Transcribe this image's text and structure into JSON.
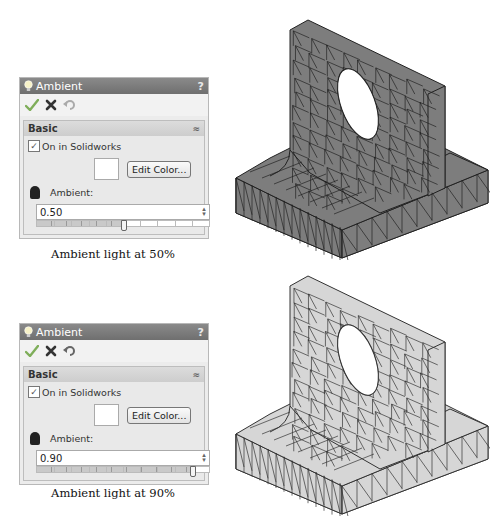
{
  "panels": [
    {
      "title": "Ambient",
      "help": "?",
      "toolbar": {
        "ok_icon": "checkmark-icon",
        "cancel_icon": "x-icon",
        "undo_icon": "undo-icon"
      },
      "section": {
        "title": "Basic",
        "collapse_icon": "double-chevron-up-icon"
      },
      "on_in_solidworks": {
        "label": "On in Solidworks",
        "checked": true,
        "check_glyph": "✓"
      },
      "edit_color_label": "Edit Color...",
      "ambient_label": "Ambient:",
      "ambient_value": "0.50",
      "slider_percent": 50,
      "spin_glyph": "⌃⌄",
      "caption": "Ambient light at 50%"
    },
    {
      "title": "Ambient",
      "help": "?",
      "toolbar": {
        "ok_icon": "checkmark-icon",
        "cancel_icon": "x-icon",
        "undo_icon": "undo-icon"
      },
      "section": {
        "title": "Basic",
        "collapse_icon": "double-chevron-up-icon"
      },
      "on_in_solidworks": {
        "label": "On in Solidworks",
        "checked": true,
        "check_glyph": "✓"
      },
      "edit_color_label": "Edit Color...",
      "ambient_label": "Ambient:",
      "ambient_value": "0.90",
      "slider_percent": 90,
      "spin_glyph": "⌃⌄",
      "caption": "Ambient light at 90%"
    }
  ],
  "models": [
    {
      "description": "Meshed bracket model, dark shading",
      "fill": "#7d7d7d",
      "mesh": "#222222"
    },
    {
      "description": "Meshed bracket model, light shading",
      "fill": "#d6d6d6",
      "mesh": "#333333"
    }
  ],
  "colors": {
    "titlebar": "#7a7a7a",
    "panel_bg": "#ececec",
    "check_green": "#7fae5a",
    "cancel_dark": "#333333"
  }
}
